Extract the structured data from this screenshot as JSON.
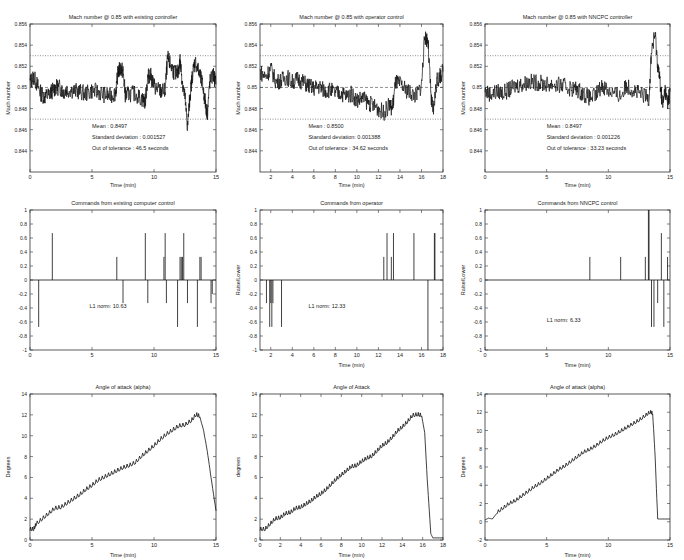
{
  "chart_data": [
    {
      "id": "mach_existing",
      "type": "line",
      "title": "Mach number @ 0.85 with existing controller",
      "xlabel": "Time (min)",
      "ylabel": "Mach number",
      "xlim": [
        0,
        15
      ],
      "ylim": [
        0.842,
        0.856
      ],
      "xticks": [
        0,
        5,
        10,
        15
      ],
      "xtick_labels": [
        "0",
        "5",
        "10",
        "15"
      ],
      "yticks": [
        0.844,
        0.846,
        0.848,
        0.85,
        0.852,
        0.854,
        0.856
      ],
      "ytick_labels": [
        "0.844",
        "0.846",
        "0.848",
        "0.85",
        "0.852",
        "0.854",
        "0.856"
      ],
      "reference_lines": [
        {
          "y": 0.853,
          "style": "dotted"
        },
        {
          "y": 0.85,
          "style": "dashed"
        },
        {
          "y": 0.847,
          "style": "dotted"
        }
      ],
      "annotations": [
        "Mean : 0.8497",
        "Standard deviation : 0.001527",
        "Out of tolerance :  46.5 seconds"
      ],
      "annotation_pos": [
        5,
        0.8462
      ],
      "series": [
        {
          "name": "Mach",
          "x": [
            0,
            0.3,
            0.6,
            0.9,
            1.2,
            1.5,
            1.8,
            2.1,
            2.4,
            2.7,
            3.0,
            3.5,
            4.0,
            4.5,
            5.0,
            5.5,
            6.0,
            6.5,
            6.9,
            7.1,
            7.3,
            7.5,
            7.7,
            8.0,
            8.5,
            9.0,
            9.3,
            9.5,
            9.7,
            10.0,
            10.3,
            10.6,
            10.9,
            11.1,
            11.3,
            11.6,
            11.9,
            12.1,
            12.3,
            12.5,
            12.7,
            12.9,
            13.1,
            13.3,
            13.6,
            13.9,
            14.1,
            14.3,
            14.5,
            14.8,
            15.0
          ],
          "y": [
            0.8505,
            0.851,
            0.8502,
            0.8494,
            0.8491,
            0.8493,
            0.8497,
            0.85,
            0.85,
            0.8496,
            0.8498,
            0.8497,
            0.8496,
            0.8494,
            0.8497,
            0.8496,
            0.8493,
            0.8492,
            0.8495,
            0.8515,
            0.8518,
            0.8515,
            0.8492,
            0.8494,
            0.8494,
            0.8489,
            0.8487,
            0.851,
            0.8512,
            0.8502,
            0.8498,
            0.8496,
            0.8497,
            0.8528,
            0.8522,
            0.8515,
            0.8512,
            0.8525,
            0.8505,
            0.849,
            0.8462,
            0.8492,
            0.8512,
            0.8525,
            0.8515,
            0.8503,
            0.8488,
            0.8475,
            0.8505,
            0.8512,
            0.8503
          ]
        }
      ]
    },
    {
      "id": "mach_operator",
      "type": "line",
      "title": "Mach number @ 0.85 with operator control",
      "xlabel": "Time (min)",
      "ylabel": "Mach number",
      "xlim": [
        1,
        18
      ],
      "ylim": [
        0.842,
        0.856
      ],
      "xticks": [
        2,
        4,
        6,
        8,
        10,
        12,
        14,
        16,
        18
      ],
      "xtick_labels": [
        "2",
        "4",
        "6",
        "8",
        "10",
        "12",
        "14",
        "16",
        "18"
      ],
      "yticks": [
        0.844,
        0.846,
        0.848,
        0.85,
        0.852,
        0.854,
        0.856
      ],
      "ytick_labels": [
        "0.844",
        "0.846",
        "0.848",
        "0.85",
        "0.852",
        "0.854",
        "0.856"
      ],
      "reference_lines": [
        {
          "y": 0.853,
          "style": "dotted"
        },
        {
          "y": 0.85,
          "style": "dashed"
        },
        {
          "y": 0.847,
          "style": "dotted"
        }
      ],
      "annotations": [
        "Mean : 0.8500",
        "Standard deviation: 0.001388",
        "Out of tolerance : 34.62 seconds"
      ],
      "annotation_pos": [
        5.5,
        0.8462
      ],
      "series": [
        {
          "name": "Mach",
          "x": [
            1,
            1.5,
            2,
            2.5,
            3,
            3.5,
            4,
            4.5,
            5,
            5.5,
            6,
            6.5,
            7,
            7.5,
            8,
            8.5,
            9,
            9.5,
            10,
            10.5,
            11,
            11.5,
            12,
            12.5,
            13,
            13.3,
            13.6,
            14,
            14.5,
            15,
            15.5,
            16,
            16.3,
            16.6,
            16.9,
            17.1,
            17.4,
            17.7,
            18
          ],
          "y": [
            0.8515,
            0.851,
            0.8518,
            0.8505,
            0.8507,
            0.851,
            0.8505,
            0.8508,
            0.8505,
            0.8502,
            0.8499,
            0.8501,
            0.8497,
            0.8498,
            0.8494,
            0.8495,
            0.8492,
            0.8494,
            0.8488,
            0.849,
            0.8486,
            0.8483,
            0.848,
            0.8476,
            0.8483,
            0.848,
            0.8505,
            0.8503,
            0.8498,
            0.8495,
            0.8492,
            0.8502,
            0.8548,
            0.8545,
            0.8488,
            0.8478,
            0.8505,
            0.851,
            0.8515
          ]
        }
      ]
    },
    {
      "id": "mach_nncpc",
      "type": "line",
      "title": "Mach number @ 0.85 with NNCPC controller",
      "xlabel": "Time (min)",
      "ylabel": "Mach number",
      "xlim": [
        0,
        15
      ],
      "ylim": [
        0.842,
        0.856
      ],
      "xticks": [
        0,
        5,
        10,
        15
      ],
      "xtick_labels": [
        "0",
        "5",
        "10",
        "15"
      ],
      "yticks": [
        0.844,
        0.846,
        0.848,
        0.85,
        0.852,
        0.854,
        0.856
      ],
      "ytick_labels": [
        "0.844",
        "0.846",
        "0.848",
        "0.85",
        "0.852",
        "0.854",
        "0.856"
      ],
      "reference_lines": [
        {
          "y": 0.853,
          "style": "dotted"
        },
        {
          "y": 0.85,
          "style": "dashed"
        },
        {
          "y": 0.847,
          "style": "dotted"
        }
      ],
      "annotations": [
        "Mean : 0.8497",
        "Standard deviation : 0.001226",
        "Out of tolerance : 33.23 seconds"
      ],
      "annotation_pos": [
        5,
        0.8462
      ],
      "series": [
        {
          "name": "Mach",
          "x": [
            0,
            0.5,
            1,
            1.5,
            2,
            2.5,
            3,
            3.5,
            4,
            4.5,
            5,
            5.5,
            6,
            6.5,
            7,
            7.5,
            8,
            8.5,
            9,
            9.5,
            10,
            10.5,
            11,
            11.5,
            12,
            12.5,
            13,
            13.3,
            13.5,
            13.8,
            14,
            14.2,
            14.4,
            14.6,
            14.8,
            15
          ],
          "y": [
            0.8496,
            0.8494,
            0.8496,
            0.8495,
            0.8498,
            0.8502,
            0.8503,
            0.8505,
            0.8505,
            0.8504,
            0.8503,
            0.8503,
            0.8502,
            0.8501,
            0.8499,
            0.8498,
            0.8494,
            0.849,
            0.8493,
            0.8502,
            0.8498,
            0.8494,
            0.8492,
            0.8502,
            0.8498,
            0.8494,
            0.8492,
            0.849,
            0.8535,
            0.855,
            0.8522,
            0.8505,
            0.8482,
            0.8498,
            0.8485,
            0.8496
          ]
        }
      ]
    },
    {
      "id": "commands_existing",
      "type": "stem",
      "title": "Commands from existing computer control",
      "xlabel": "",
      "ylabel": "",
      "xlim": [
        0,
        15
      ],
      "ylim": [
        -1,
        1
      ],
      "xticks": [
        0,
        5,
        10,
        15
      ],
      "xtick_labels": [
        "0",
        "5",
        "10",
        "15"
      ],
      "yticks": [
        -1,
        -0.8,
        -0.6,
        -0.4,
        -0.2,
        0,
        0.2,
        0.4,
        0.6,
        0.8,
        1
      ],
      "ytick_labels": [
        "-1",
        "-0.8",
        "-0.6",
        "-0.4",
        "-0.2",
        "0",
        "0.2",
        "0.4",
        "0.6",
        "0.8",
        "1"
      ],
      "annotations": [
        "L1 norm: 10.63"
      ],
      "annotation_pos": [
        4.8,
        -0.4
      ],
      "series": [
        {
          "name": "Command",
          "x": [
            0.7,
            1.8,
            7.0,
            7.5,
            9.3,
            9.5,
            10.8,
            10.9,
            11.0,
            11.9,
            12.1,
            12.2,
            12.3,
            12.4,
            12.7,
            13.5,
            13.7,
            13.8,
            14.6,
            14.7
          ],
          "y": [
            -0.67,
            0.67,
            0.33,
            -0.33,
            0.67,
            -0.33,
            0.33,
            0.67,
            -0.33,
            -0.67,
            0.33,
            0.33,
            0.33,
            0.67,
            -0.33,
            -0.67,
            0.33,
            0.33,
            -0.33,
            -0.2
          ]
        }
      ]
    },
    {
      "id": "commands_operator",
      "type": "stem",
      "title": "Commands from operator",
      "xlabel": "Time (min)",
      "ylabel": "Raise/Lower",
      "xlim": [
        1,
        18
      ],
      "ylim": [
        -1,
        1
      ],
      "xticks": [
        2,
        4,
        6,
        8,
        10,
        12,
        14,
        16,
        18
      ],
      "xtick_labels": [
        "2",
        "4",
        "6",
        "8",
        "10",
        "12",
        "14",
        "16",
        "18"
      ],
      "yticks": [
        -1,
        -0.8,
        -0.6,
        -0.4,
        -0.2,
        0,
        0.2,
        0.4,
        0.6,
        0.8,
        1
      ],
      "ytick_labels": [
        "-1",
        "-0.8",
        "-0.6",
        "-0.4",
        "-0.2",
        "0",
        "0.2",
        "0.4",
        "0.6",
        "0.8",
        "1"
      ],
      "annotations": [
        "L1 norm: 12.33"
      ],
      "annotation_pos": [
        5.5,
        -0.4
      ],
      "series": [
        {
          "name": "Command",
          "x": [
            1.6,
            1.9,
            2.0,
            2.1,
            2.2,
            3.0,
            12.5,
            12.8,
            13.2,
            13.4,
            15.3,
            16.6,
            17.2,
            17.25
          ],
          "y": [
            -0.33,
            -0.67,
            -0.33,
            -0.67,
            -0.33,
            -0.67,
            0.33,
            0.67,
            0.33,
            0.67,
            0.67,
            -1.0,
            0.67,
            0.67
          ]
        }
      ]
    },
    {
      "id": "commands_nncpc",
      "type": "stem",
      "title": "Commands from NNCPC control",
      "xlabel": "Time (min)",
      "ylabel": "Raise/Lower",
      "xlim": [
        0,
        15
      ],
      "ylim": [
        -1,
        1
      ],
      "xticks": [
        0,
        5,
        10,
        15
      ],
      "xtick_labels": [
        "0",
        "5",
        "10",
        "15"
      ],
      "yticks": [
        -1,
        -0.8,
        -0.6,
        -0.4,
        -0.2,
        0,
        0.2,
        0.4,
        0.6,
        0.8,
        1
      ],
      "ytick_labels": [
        "-1",
        "-0.8",
        "-0.6",
        "-0.4",
        "-0.2",
        "0",
        "0.2",
        "0.4",
        "0.6",
        "0.8",
        "1"
      ],
      "annotations": [
        "L1 norm: 6.33"
      ],
      "annotation_pos": [
        5,
        -0.6
      ],
      "series": [
        {
          "name": "Command",
          "x": [
            8.5,
            11.0,
            13.0,
            13.25,
            13.3,
            13.5,
            13.7,
            14.0,
            14.3,
            14.5,
            14.8
          ],
          "y": [
            0.33,
            0.33,
            0.33,
            1.0,
            1.0,
            -0.67,
            -0.67,
            -0.33,
            0.67,
            -0.67,
            0.33
          ]
        }
      ]
    },
    {
      "id": "aoa_existing",
      "type": "line",
      "title": "Angle of attack (alpha)",
      "xlabel": "Time (min)",
      "ylabel": "Degrees",
      "xlim": [
        0,
        15
      ],
      "ylim": [
        0,
        14
      ],
      "xticks": [
        0,
        5,
        10,
        15
      ],
      "xtick_labels": [
        "0",
        "5",
        "10",
        "15"
      ],
      "yticks": [
        0,
        2,
        4,
        6,
        8,
        10,
        12,
        14
      ],
      "ytick_labels": [
        "0",
        "2",
        "4",
        "6",
        "8",
        "10",
        "12",
        "14"
      ],
      "series": [
        {
          "name": "Alpha",
          "x": [
            0,
            0.3,
            0.5,
            1,
            1.5,
            2,
            2.5,
            3,
            3.5,
            4,
            4.5,
            5,
            5.5,
            6,
            6.5,
            7,
            7.5,
            8,
            8.5,
            9,
            9.5,
            10,
            10.5,
            11,
            11.5,
            12,
            12.5,
            13,
            13.4,
            13.7,
            14,
            14.3,
            14.6,
            15
          ],
          "y": [
            1.0,
            1.0,
            1.5,
            2.0,
            2.5,
            3.0,
            3.1,
            3.5,
            3.9,
            4.3,
            4.8,
            5.2,
            5.7,
            6.0,
            6.3,
            6.6,
            6.9,
            7.1,
            7.4,
            8.0,
            8.5,
            9.0,
            9.6,
            10.1,
            10.5,
            10.9,
            11.0,
            11.4,
            12.0,
            11.8,
            10.5,
            8.5,
            6.0,
            2.8
          ]
        }
      ]
    },
    {
      "id": "aoa_operator",
      "type": "line",
      "title": "Angle of Attack",
      "xlabel": "Time (min)",
      "ylabel": "degrees",
      "xlim": [
        0,
        18
      ],
      "ylim": [
        0,
        14
      ],
      "xticks": [
        0,
        2,
        4,
        6,
        8,
        10,
        12,
        14,
        16,
        18
      ],
      "xtick_labels": [
        "0",
        "2",
        "4",
        "6",
        "8",
        "10",
        "12",
        "14",
        "16",
        "18"
      ],
      "yticks": [
        0,
        2,
        4,
        6,
        8,
        10,
        12,
        14
      ],
      "ytick_labels": [
        "0",
        "2",
        "4",
        "6",
        "8",
        "10",
        "12",
        "14"
      ],
      "series": [
        {
          "name": "Alpha",
          "x": [
            0,
            0.5,
            1,
            1.5,
            2,
            2.5,
            3,
            3.5,
            4,
            4.5,
            5,
            5.5,
            6,
            6.5,
            7,
            7.5,
            8,
            8.5,
            9,
            9.5,
            10,
            10.5,
            11,
            11.5,
            12,
            12.5,
            13,
            13.5,
            14,
            14.5,
            15,
            15.5,
            15.9,
            16.2,
            16.5,
            16.8,
            17,
            18
          ],
          "y": [
            1.0,
            1.0,
            1.5,
            2.0,
            2.1,
            2.5,
            2.6,
            3.0,
            3.1,
            3.4,
            3.7,
            4.1,
            4.4,
            4.8,
            5.3,
            5.8,
            6.2,
            6.6,
            7.0,
            7.1,
            7.5,
            7.8,
            8.0,
            8.5,
            9.0,
            9.3,
            9.8,
            10.4,
            10.8,
            11.3,
            11.9,
            12.0,
            11.9,
            10.3,
            5.0,
            0.6,
            0.2,
            0.2
          ]
        }
      ]
    },
    {
      "id": "aoa_nncpc",
      "type": "line",
      "title": "Angle of attack (alpha)",
      "xlabel": "Time (min)",
      "ylabel": "Degrees",
      "xlim": [
        0,
        15
      ],
      "ylim": [
        -2,
        14
      ],
      "xticks": [
        0,
        5,
        10,
        15
      ],
      "xtick_labels": [
        "0",
        "5",
        "10",
        "15"
      ],
      "yticks": [
        -2,
        0,
        2,
        4,
        6,
        8,
        10,
        12,
        14
      ],
      "ytick_labels": [
        "-2",
        "0",
        "2",
        "4",
        "6",
        "8",
        "10",
        "12",
        "14"
      ],
      "series": [
        {
          "name": "Alpha",
          "x": [
            0,
            0.3,
            0.6,
            1,
            1.5,
            2,
            2.5,
            3,
            3.5,
            4,
            4.5,
            5,
            5.5,
            6,
            6.5,
            7,
            7.5,
            8,
            8.5,
            9,
            9.5,
            10,
            10.5,
            11,
            11.5,
            12,
            12.5,
            13,
            13.4,
            13.6,
            13.8,
            14,
            14.3,
            15
          ],
          "y": [
            0.2,
            0.4,
            0.3,
            1.0,
            1.5,
            2.0,
            2.3,
            2.8,
            3.3,
            3.8,
            4.2,
            4.7,
            5.2,
            5.7,
            6.1,
            6.6,
            7.1,
            7.6,
            7.9,
            8.3,
            8.8,
            9.2,
            9.5,
            9.9,
            10.3,
            10.7,
            11.1,
            11.6,
            12.0,
            11.8,
            7.0,
            0.3,
            0.3,
            0.3
          ]
        }
      ]
    }
  ]
}
